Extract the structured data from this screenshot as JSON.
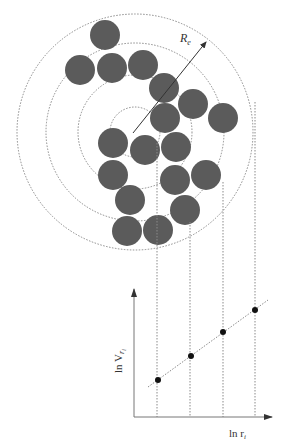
{
  "diagram": {
    "colors": {
      "particle_fill": "#5b5b5b",
      "dotted_line": "#8a8a8a",
      "axis": "#777777",
      "point": "#111111",
      "arrow": "#333333"
    },
    "labels": {
      "radius": "R",
      "radius_sub": "e",
      "y_axis": "ln V",
      "y_axis_sub": "r",
      "y_axis_subsub": "i",
      "x_axis": "ln r",
      "x_axis_sub": "i"
    },
    "concentric_center": [
      135,
      132
    ],
    "concentric_radii": [
      25,
      57,
      89,
      118
    ],
    "particles": [
      [
        105,
        35
      ],
      [
        80,
        70
      ],
      [
        112,
        68
      ],
      [
        143,
        65
      ],
      [
        164,
        88
      ],
      [
        193,
        104
      ],
      [
        223,
        118
      ],
      [
        165,
        118
      ],
      [
        113,
        143
      ],
      [
        145,
        150
      ],
      [
        176,
        147
      ],
      [
        113,
        175
      ],
      [
        175,
        180
      ],
      [
        206,
        175
      ],
      [
        130,
        200
      ],
      [
        185,
        210
      ],
      [
        127,
        231
      ],
      [
        158,
        230
      ]
    ],
    "particle_radius": 15,
    "radius_arrow": {
      "from": [
        133,
        133
      ],
      "to": [
        206,
        42
      ]
    },
    "projection_lines_x": [
      157,
      190,
      223,
      255
    ],
    "projection_lines_start_y": [
      143,
      222,
      182,
      102
    ]
  },
  "chart_data": {
    "type": "scatter",
    "title": "",
    "xlabel": "ln r_i",
    "ylabel": "ln V_r_i",
    "x": [
      1,
      2,
      3,
      4
    ],
    "y": [
      1,
      2,
      3,
      4
    ],
    "trend_line": "linear dotted fit",
    "points_px": [
      [
        158,
        380
      ],
      [
        191,
        356
      ],
      [
        223,
        332
      ],
      [
        255,
        310
      ]
    ],
    "grid": false
  }
}
